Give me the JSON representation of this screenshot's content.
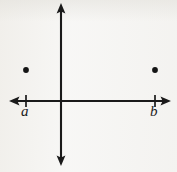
{
  "figure": {
    "title": "",
    "background_color": "#f5f4f2",
    "ink_color": "#1a1a1a",
    "width": 177,
    "height": 172
  },
  "labels": {
    "a": "a",
    "b": "b"
  },
  "chart_data": {
    "type": "scatter",
    "title": "",
    "xlabel": "",
    "ylabel": "",
    "grid": false,
    "legend": null,
    "axes": {
      "style": "cartesian-cross-with-arrows",
      "origin_px": [
        61,
        101
      ],
      "x_axis": {
        "y_px": 101,
        "start_px": 11,
        "end_px": 169,
        "arrow_start": true,
        "arrow_end": true
      },
      "y_axis": {
        "x_px": 61,
        "start_px": 5,
        "end_px": 163,
        "arrow_start": true,
        "arrow_end": true
      }
    },
    "ticks": [
      {
        "label": "a",
        "axis": "x",
        "x_px": 26,
        "value": "a",
        "label_position": "below"
      },
      {
        "label": "b",
        "axis": "x",
        "x_px": 155,
        "value": "b",
        "label_position": "below"
      }
    ],
    "points": [
      {
        "name": "point-a",
        "x": "a",
        "y": "positive",
        "x_px": 26,
        "y_px": 70,
        "quadrant": 2,
        "marker": "filled-circle",
        "radius_px": 2.9,
        "color": "#141414"
      },
      {
        "name": "point-b",
        "x": "b",
        "y": "positive",
        "x_px": 155,
        "y_px": 70,
        "quadrant": 1,
        "marker": "filled-circle",
        "radius_px": 2.9,
        "color": "#141414"
      }
    ]
  }
}
